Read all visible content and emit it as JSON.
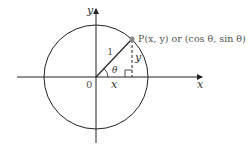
{
  "diagram": {
    "type": "unit-circle",
    "labels": {
      "y_axis": "y",
      "x_axis": "x",
      "origin": "0",
      "radius": "1",
      "angle": "θ",
      "x_leg": "x",
      "y_leg": "y",
      "point": "P(x, y) or (cos θ, sin θ)"
    },
    "colors": {
      "line": "#222222",
      "point": "#888888",
      "point_label": "#555555"
    }
  }
}
